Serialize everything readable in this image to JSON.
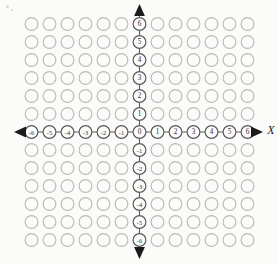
{
  "diagram": {
    "type": "coordinate-plane",
    "background_color": "#fbfbfa",
    "grid": {
      "circle_stroke_color": "#b9b9b7",
      "circle_fill_color": "#fbfbfa",
      "circle_radius": 6.4,
      "cell_spacing": 18.0,
      "x_min": -6,
      "x_max": 6,
      "y_min": -6,
      "y_max": 6,
      "columns": 13,
      "rows": 13,
      "total_circles": 169
    },
    "origin": {
      "label": "0",
      "px_x": 139.5,
      "px_y": 132.0
    },
    "x_axis": {
      "name": "X",
      "name_style": "italic",
      "axis_color": "#5d5d5c",
      "label_circle_stroke_color": "#58585a",
      "ticks": [
        {
          "value": -6,
          "label": "-6"
        },
        {
          "value": -5,
          "label": "-5"
        },
        {
          "value": -4,
          "label": "-4"
        },
        {
          "value": -3,
          "label": "-3"
        },
        {
          "value": -2,
          "label": "-2"
        },
        {
          "value": -1,
          "label": "-1"
        },
        {
          "value": 0,
          "label": "0"
        },
        {
          "value": 1,
          "label": "1"
        },
        {
          "value": 2,
          "label": "2"
        },
        {
          "value": 3,
          "label": "3"
        },
        {
          "value": 4,
          "label": "4"
        },
        {
          "value": 5,
          "label": "5"
        },
        {
          "value": 6,
          "label": "6"
        }
      ],
      "arrow_left": true,
      "arrow_right": true
    },
    "y_axis": {
      "name": "",
      "axis_color": "#5d5d5c",
      "label_circle_stroke_color": "#58585a",
      "ticks": [
        {
          "value": 6,
          "label": "6"
        },
        {
          "value": 5,
          "label": "5"
        },
        {
          "value": 4,
          "label": "4"
        },
        {
          "value": 3,
          "label": "3"
        },
        {
          "value": 2,
          "label": "2"
        },
        {
          "value": 1,
          "label": "1"
        },
        {
          "value": -1,
          "label": "-1"
        },
        {
          "value": -2,
          "label": "-2"
        },
        {
          "value": -3,
          "label": "-3"
        },
        {
          "value": -4,
          "label": "-4"
        },
        {
          "value": -5,
          "label": "-5"
        },
        {
          "value": -6,
          "label": "-6"
        }
      ],
      "arrow_up": true,
      "arrow_down": true
    }
  }
}
